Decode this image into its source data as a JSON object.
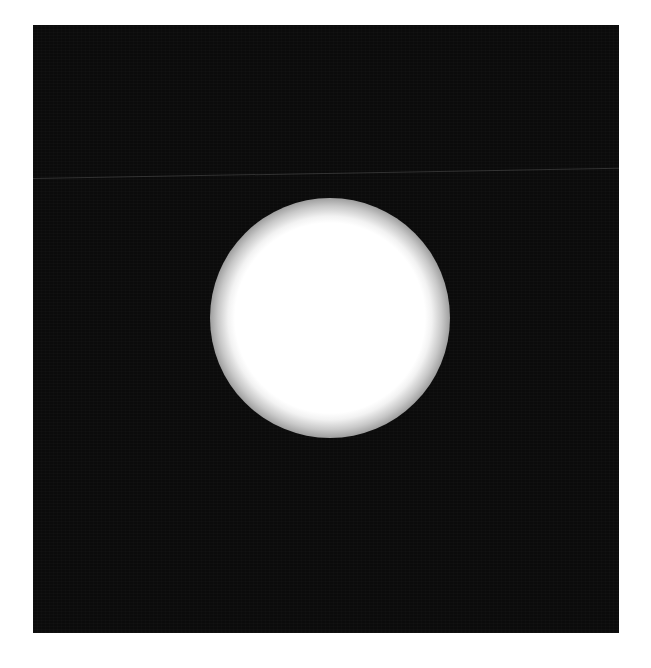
{
  "image": {
    "description": "Bright white glowing circular orb centered on a dark noisy background",
    "colors": {
      "background_page": "#ffffff",
      "frame": "#0b0b0b",
      "orb_core": "#ffffff"
    }
  }
}
